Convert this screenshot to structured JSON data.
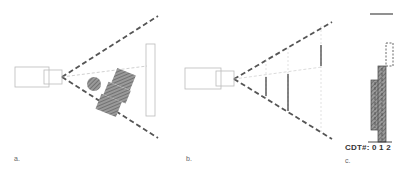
{
  "panels": [
    {
      "id": "a",
      "label": "a.",
      "description": "Camera view frustum with occluding objects (circle and stacked hatched boxes) in front of a vertical plane"
    },
    {
      "id": "b",
      "label": "b.",
      "description": "Camera view frustum with vertical line segments at increasing depths"
    },
    {
      "id": "c",
      "label": "c.",
      "description": "Stacked histogram of CDT numbers"
    }
  ],
  "panel_c": {
    "axis_label": "CDT#:",
    "ticks": [
      "0",
      "1",
      "2"
    ]
  },
  "colors": {
    "frustum_dash": "#555555",
    "light_lines": "#bbbbbb",
    "hatch_fill": "#777777",
    "background": "#ffffff"
  }
}
